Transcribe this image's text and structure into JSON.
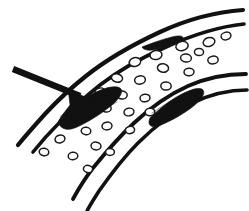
{
  "figure": {
    "background_color": "#ffffff",
    "ink_color": "#111111",
    "width": 249,
    "height": 211
  },
  "pointer": {
    "name": "lesion-pointer-arrow",
    "shaft_path": "M 13 69 L 80 96",
    "shaft_width": 6.5,
    "head_points": "96 103 68 88 70 105 60 118",
    "color": "#111111"
  },
  "vessel_walls": [
    {
      "id": "upper-outer-wall",
      "path": "M 243 10 C 214 12 186 20 160 32 C 132 45 106 60 86 76 C 72 87 58 100 45 114 C 36 124 27 134 18 145",
      "width": 4.2
    },
    {
      "id": "upper-inner-wall",
      "path": "M 244 24 C 216 27 190 36 166 47 C 141 58 118 71 100 85 C 86 96 72 109 60 122 C 50 132 41 142 33 152",
      "width": 3.6
    },
    {
      "id": "lower-inner-wall",
      "path": "M 246 74 C 226 74 206 78 188 86 C 168 95 150 108 134 123 C 120 136 106 152 93 168 C 86 177 79 188 73 199",
      "width": 3.8
    },
    {
      "id": "lower-outer-wall",
      "path": "M 247 90 C 228 90 209 95 192 103 C 172 113 154 127 138 143 C 124 157 111 174 99 191 C 94 199 90 205 87 211",
      "width": 3.6
    }
  ],
  "lesions": [
    {
      "id": "left-plaque-lesion",
      "label": "atherosclerotic-plaque-left",
      "body_path": "M 58 122 C 66 112 78 101 92 94 C 104 88 114 85 120 88 C 124 91 120 98 112 105 C 101 114 88 122 77 127 C 68 131 61 130 58 122 Z",
      "hatch_paths": [
        "M 63 121 C 76 112 92 101 112 93",
        "M 67 126 C 80 118 96 107 116 97",
        "M 61 116 C 72 108 88 97 106 90",
        "M 72 128 C 84 121 99 111 117 102"
      ],
      "cx": 90,
      "cy": 108
    },
    {
      "id": "right-plaque-lesion",
      "label": "atherosclerotic-plaque-right",
      "body_path": "M 150 118 C 158 110 170 100 182 94 C 192 89 200 87 203 90 C 206 94 200 101 191 108 C 180 116 167 123 158 126 C 151 128 147 125 150 118 Z",
      "hatch_paths": [
        "M 154 118 C 166 109 181 99 199 92",
        "M 158 123 C 170 115 185 105 201 97",
        "M 152 113 C 164 105 179 95 195 89"
      ],
      "cx": 177,
      "cy": 107
    },
    {
      "id": "upper-wall-thickening",
      "label": "intimal-thickening",
      "body_path": "M 142 47 C 150 44 160 40 172 37 C 180 35 184 36 183 39 C 181 42 172 45 162 48 C 152 51 144 51 142 47 Z",
      "hatch_paths": [
        "M 145 47 C 155 43 167 39 180 37"
      ],
      "cx": 162,
      "cy": 43
    }
  ],
  "blood_cells": [
    {
      "cx": 209,
      "cy": 42,
      "rx": 6.0,
      "ry": 4.4,
      "rot": -18
    },
    {
      "cx": 182,
      "cy": 46,
      "rx": 6.2,
      "ry": 4.6,
      "rot": -12
    },
    {
      "cx": 156,
      "cy": 55,
      "rx": 6.0,
      "ry": 4.5,
      "rot": -10
    },
    {
      "cx": 186,
      "cy": 58,
      "rx": 5.4,
      "ry": 4.0,
      "rot": 5
    },
    {
      "cx": 213,
      "cy": 60,
      "rx": 5.2,
      "ry": 3.9,
      "rot": -8
    },
    {
      "cx": 135,
      "cy": 62,
      "rx": 5.8,
      "ry": 4.4,
      "rot": -15
    },
    {
      "cx": 163,
      "cy": 68,
      "rx": 5.6,
      "ry": 4.2,
      "rot": 8
    },
    {
      "cx": 189,
      "cy": 72,
      "rx": 5.0,
      "ry": 3.8,
      "rot": -5
    },
    {
      "cx": 117,
      "cy": 78,
      "rx": 5.6,
      "ry": 4.2,
      "rot": 12
    },
    {
      "cx": 140,
      "cy": 80,
      "rx": 5.4,
      "ry": 4.1,
      "rot": -10
    },
    {
      "cx": 166,
      "cy": 86,
      "rx": 5.2,
      "ry": 4.0,
      "rot": 4
    },
    {
      "cx": 100,
      "cy": 92,
      "rx": 5.0,
      "ry": 3.9,
      "rot": -20
    },
    {
      "cx": 122,
      "cy": 95,
      "rx": 5.2,
      "ry": 4.0,
      "rot": 6
    },
    {
      "cx": 145,
      "cy": 98,
      "rx": 5.0,
      "ry": 3.8,
      "rot": -6
    },
    {
      "cx": 106,
      "cy": 108,
      "rx": 5.2,
      "ry": 4.0,
      "rot": 10
    },
    {
      "cx": 129,
      "cy": 112,
      "rx": 5.0,
      "ry": 3.8,
      "rot": -12
    },
    {
      "cx": 83,
      "cy": 116,
      "rx": 5.0,
      "ry": 3.9,
      "rot": 4
    },
    {
      "cx": 150,
      "cy": 112,
      "rx": 4.8,
      "ry": 3.7,
      "rot": -4
    },
    {
      "cx": 64,
      "cy": 122,
      "rx": 5.0,
      "ry": 3.8,
      "rot": 14
    },
    {
      "cx": 107,
      "cy": 126,
      "rx": 5.0,
      "ry": 3.9,
      "rot": -8
    },
    {
      "cx": 86,
      "cy": 131,
      "rx": 4.8,
      "ry": 3.7,
      "rot": 6
    },
    {
      "cx": 130,
      "cy": 130,
      "rx": 4.6,
      "ry": 3.6,
      "rot": -10
    },
    {
      "cx": 60,
      "cy": 139,
      "rx": 5.0,
      "ry": 3.8,
      "rot": -14
    },
    {
      "cx": 96,
      "cy": 146,
      "rx": 5.0,
      "ry": 3.9,
      "rot": 8
    },
    {
      "cx": 44,
      "cy": 152,
      "rx": 4.8,
      "ry": 3.7,
      "rot": 10
    },
    {
      "cx": 73,
      "cy": 156,
      "rx": 4.8,
      "ry": 3.7,
      "rot": -6
    },
    {
      "cx": 110,
      "cy": 152,
      "rx": 4.4,
      "ry": 3.4,
      "rot": 0
    },
    {
      "cx": 88,
      "cy": 169,
      "rx": 4.6,
      "ry": 3.6,
      "rot": 12
    },
    {
      "cx": 226,
      "cy": 36,
      "rx": 5.0,
      "ry": 3.8,
      "rot": -16
    },
    {
      "cx": 199,
      "cy": 52,
      "rx": 4.6,
      "ry": 3.6,
      "rot": 2
    }
  ]
}
